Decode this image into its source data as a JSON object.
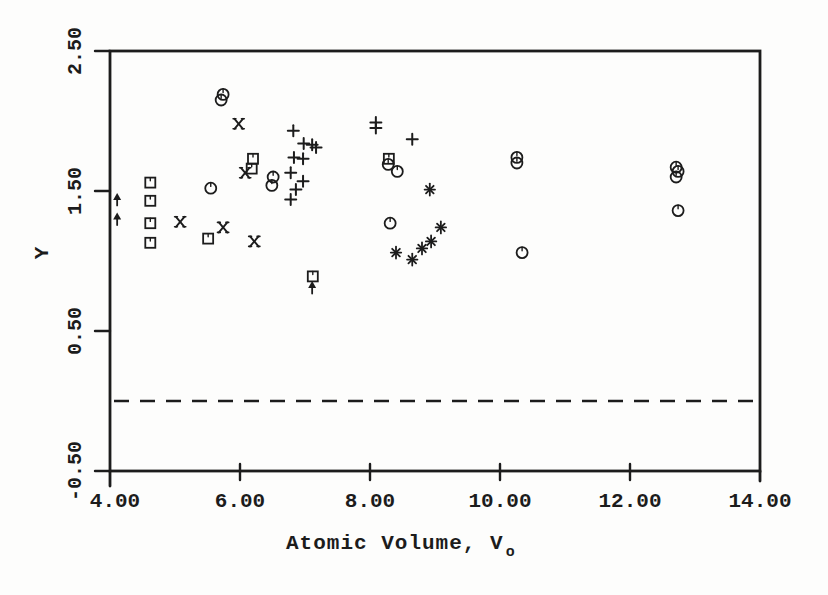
{
  "figure": {
    "background": "#fdfdfc",
    "ink_color": "#1c1c1c"
  },
  "chart_data": {
    "type": "scatter",
    "title": "",
    "xlabel_main": "Atomic Volume, V",
    "xlabel_subscript": "o",
    "ylabel": "Y",
    "xlim": [
      4.0,
      14.0
    ],
    "ylim": [
      -0.5,
      2.5
    ],
    "grid": false,
    "legend": "none",
    "x_ticks": [
      {
        "value": 4,
        "label": "4.00"
      },
      {
        "value": 6,
        "label": "6.00"
      },
      {
        "value": 8,
        "label": "8.00"
      },
      {
        "value": 10,
        "label": "10.00"
      },
      {
        "value": 12,
        "label": "12.00"
      },
      {
        "value": 14,
        "label": "14.00"
      }
    ],
    "y_ticks": [
      {
        "value": 2.5,
        "label": "2.50"
      },
      {
        "value": 1.5,
        "label": "1.50"
      },
      {
        "value": 0.5,
        "label": "0.50"
      },
      {
        "value": -0.5,
        "label": "-0.50"
      }
    ],
    "reference_line": {
      "y": 0.0,
      "style": "dashed"
    },
    "series": [
      {
        "name": "squares",
        "marker": "square",
        "points": [
          [
            4.62,
            1.56
          ],
          [
            4.62,
            1.43
          ],
          [
            4.62,
            1.27
          ],
          [
            4.62,
            1.13
          ],
          [
            5.51,
            1.16
          ],
          [
            6.2,
            1.73
          ],
          [
            6.18,
            1.66
          ],
          [
            7.12,
            0.89
          ],
          [
            8.29,
            1.73
          ]
        ]
      },
      {
        "name": "circles",
        "marker": "circle",
        "points": [
          [
            5.74,
            2.19
          ],
          [
            5.71,
            2.15
          ],
          [
            5.55,
            1.52
          ],
          [
            6.51,
            1.6
          ],
          [
            6.49,
            1.54
          ],
          [
            8.28,
            1.69
          ],
          [
            8.42,
            1.64
          ],
          [
            8.31,
            1.27
          ],
          [
            10.26,
            1.74
          ],
          [
            10.26,
            1.7
          ],
          [
            10.34,
            1.06
          ],
          [
            12.71,
            1.67
          ],
          [
            12.74,
            1.64
          ],
          [
            12.71,
            1.6
          ],
          [
            12.74,
            1.36
          ]
        ]
      },
      {
        "name": "pluses",
        "marker": "plus",
        "points": [
          [
            6.82,
            1.93
          ],
          [
            6.98,
            1.84
          ],
          [
            7.11,
            1.83
          ],
          [
            7.17,
            1.81
          ],
          [
            6.83,
            1.74
          ],
          [
            6.97,
            1.73
          ],
          [
            6.78,
            1.63
          ],
          [
            6.97,
            1.57
          ],
          [
            6.86,
            1.51
          ],
          [
            6.78,
            1.44
          ],
          [
            8.09,
            1.99
          ],
          [
            8.09,
            1.95
          ],
          [
            8.65,
            1.87
          ]
        ]
      },
      {
        "name": "x-marks",
        "marker": "x",
        "points": [
          [
            5.98,
            1.98
          ],
          [
            5.08,
            1.28
          ],
          [
            5.74,
            1.24
          ],
          [
            6.08,
            1.63
          ],
          [
            6.22,
            1.14
          ]
        ]
      },
      {
        "name": "asterisks",
        "marker": "asterisk",
        "points": [
          [
            8.92,
            1.51
          ],
          [
            8.4,
            1.06
          ],
          [
            8.65,
            1.01
          ],
          [
            8.8,
            1.09
          ],
          [
            8.94,
            1.14
          ],
          [
            9.09,
            1.24
          ]
        ]
      },
      {
        "name": "arrows",
        "marker": "up-arrow",
        "points": [
          [
            4.11,
            1.44
          ],
          [
            4.11,
            1.3
          ],
          [
            7.11,
            0.81
          ]
        ]
      }
    ]
  }
}
